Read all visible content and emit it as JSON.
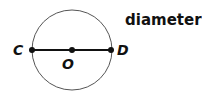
{
  "title": "diameter",
  "labels": {
    "c": "C",
    "o": "O",
    "d": "D"
  },
  "circle": {
    "cx": 72,
    "cy": 50,
    "r": 40,
    "stroke": "#555555"
  },
  "segment": {
    "from": "C",
    "to": "D",
    "stroke": "#111111"
  },
  "points": [
    {
      "name": "C",
      "x": 32,
      "y": 50
    },
    {
      "name": "O",
      "x": 72,
      "y": 50
    },
    {
      "name": "D",
      "x": 111,
      "y": 50
    }
  ]
}
